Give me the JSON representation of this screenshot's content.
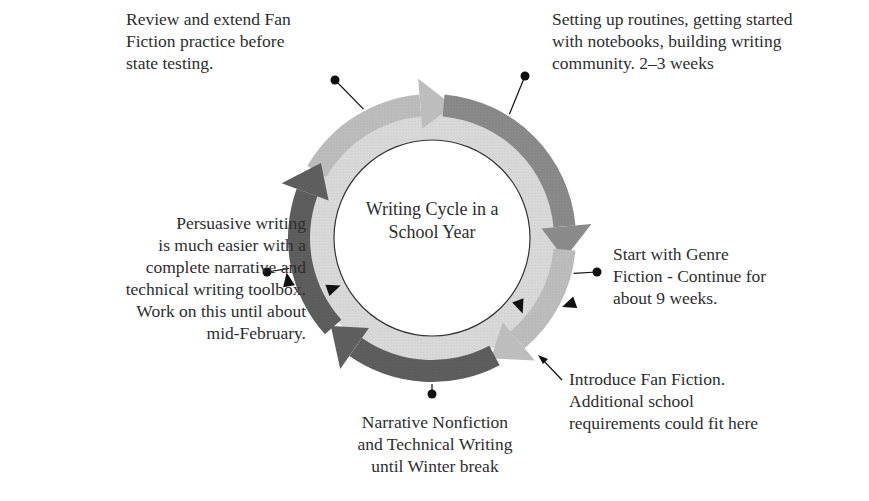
{
  "diagram": {
    "type": "cycle",
    "center_title": [
      "Writing Cycle in a",
      "School Year"
    ],
    "colors": {
      "outer_dark": "#5e5e5e",
      "outer_medium": "#8a8a8a",
      "outer_light": "#bdbdbd",
      "inner_band": "#d9d9d9",
      "center": "#ffffff",
      "text": "#2e2e2e",
      "callout": "#111111"
    },
    "stages": [
      {
        "id": "routines",
        "order": 1,
        "lines": [
          "Setting up routines, getting started",
          "with notebooks, building writing",
          "community. 2–3 weeks"
        ]
      },
      {
        "id": "genre-fiction",
        "order": 2,
        "lines": [
          "Start with Genre",
          "Fiction - Continue for",
          "about 9 weeks."
        ]
      },
      {
        "id": "fan-fiction",
        "order": 3,
        "lines": [
          "Introduce Fan Fiction.",
          "Additional school",
          "requirements could fit here"
        ]
      },
      {
        "id": "narrative-nonfiction",
        "order": 4,
        "lines": [
          "Narrative Nonfiction",
          "and Technical Writing",
          "until Winter break"
        ]
      },
      {
        "id": "persuasive",
        "order": 5,
        "lines": [
          "Persuasive writing",
          "is much easier with a",
          "complete narrative and",
          "technical writing toolbox.",
          "Work on this until about",
          "mid-February."
        ]
      },
      {
        "id": "review",
        "order": 6,
        "lines": [
          "Review and extend Fan",
          "Fiction practice before",
          "state testing."
        ]
      }
    ]
  }
}
